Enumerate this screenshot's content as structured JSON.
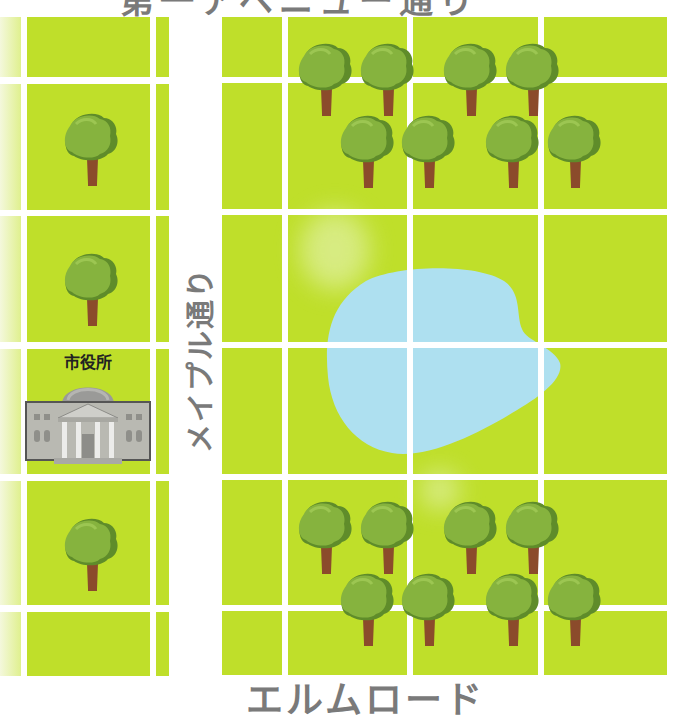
{
  "map": {
    "streets": {
      "top": "第一アベニュー通り",
      "left_vertical": "メイプル通り",
      "bottom": "エルムロード"
    },
    "landmarks": {
      "city_hall": {
        "label": "市役所",
        "icon": "city-hall-icon"
      },
      "lake": {
        "icon": "lake-shape"
      },
      "trees": {
        "left_column_count": 3,
        "top_right_cluster_count": 8,
        "bottom_right_cluster_count": 8
      }
    },
    "colors": {
      "grass": "#bfdf2a",
      "road": "#ffffff",
      "lake": "#aee0f0",
      "label": "#7a7a7a",
      "tree_canopy": "#7fae3a",
      "tree_trunk": "#8a4a2a",
      "building": "#b7b7b0"
    }
  }
}
